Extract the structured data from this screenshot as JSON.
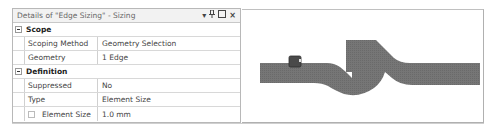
{
  "details_panel": {
    "title": "Details of \"Edge Sizing\" - Sizing",
    "title_icons": {
      "dropdown": "▾",
      "pin": "⊥",
      "maximize": "□",
      "close": "×"
    },
    "groups": [
      {
        "label": "Scope",
        "rows": [
          {
            "name": "Scoping Method",
            "value": "Geometry Selection"
          },
          {
            "name": "Geometry",
            "value": "1 Edge"
          }
        ]
      },
      {
        "label": "Definition",
        "rows": [
          {
            "name": "Suppressed",
            "value": "No"
          },
          {
            "name": "Type",
            "value": "Element Size"
          },
          {
            "name": "Element Size",
            "value": "1.0 mm",
            "has_checkbox": true
          }
        ]
      }
    ]
  },
  "viewport": {
    "mesh_color": "#707070",
    "selected_edge_marker_color": "#4a4a4a"
  }
}
